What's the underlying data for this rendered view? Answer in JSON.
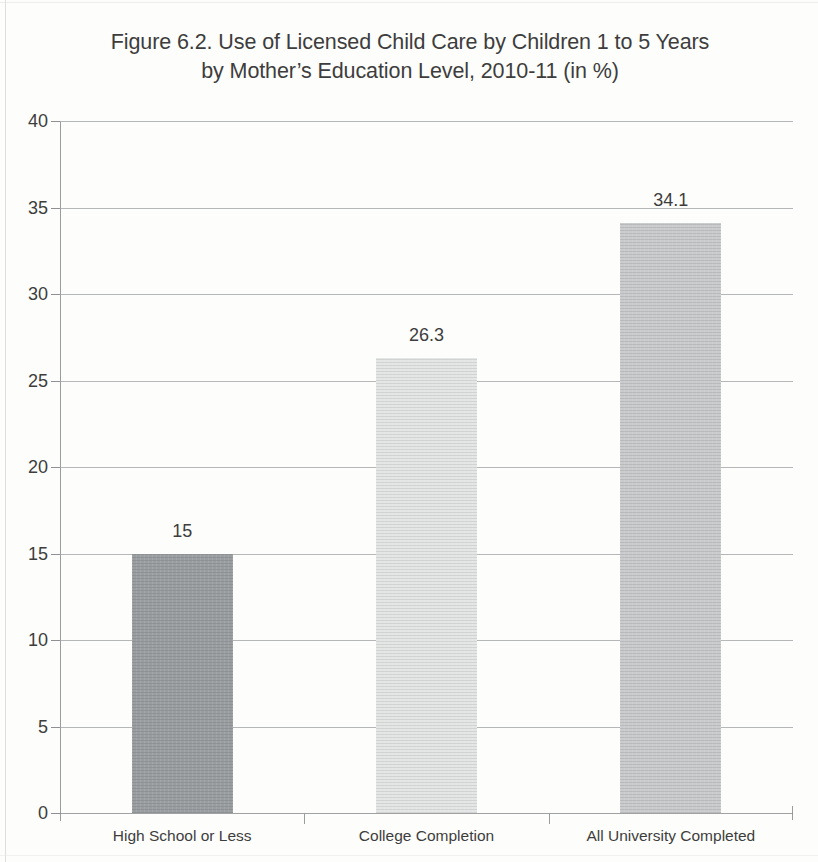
{
  "figure": {
    "title_line1": "Figure 6.2.  Use of Licensed Child Care by Children 1 to 5 Years",
    "title_line2": "by Mother’s Education Level, 2010-11 (in %)"
  },
  "chart_data": {
    "type": "bar",
    "title": "Figure 6.2.  Use of Licensed Child Care by Children 1 to 5 Years by Mother’s Education Level, 2010-11 (in %)",
    "xlabel": "",
    "ylabel": "",
    "ylim": [
      0,
      40
    ],
    "yticks": [
      0,
      5,
      10,
      15,
      20,
      25,
      30,
      35,
      40
    ],
    "ytick_labels": [
      "0",
      "5",
      "10",
      "15",
      "20",
      "25",
      "30",
      "35",
      "40"
    ],
    "grid": true,
    "legend": false,
    "categories": [
      "High School or Less",
      "College Completion",
      "All University Completed"
    ],
    "values": [
      15,
      26.3,
      34.1
    ],
    "value_labels": [
      "15",
      "26.3",
      "34.1"
    ],
    "bar_colors": [
      "#9a9ea1",
      "#e4e6e6",
      "#c9cbcc"
    ],
    "units": "%"
  },
  "colors": {
    "gridline": "#a7a9ab",
    "axis": "#9a9c9e",
    "text": "#3d3d3d",
    "page_background": "#fdfdfc"
  }
}
